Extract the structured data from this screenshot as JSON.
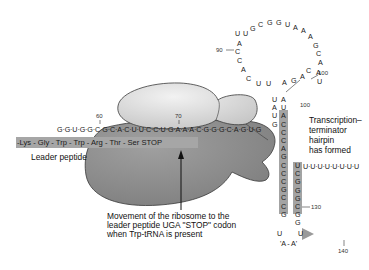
{
  "diagram": {
    "mrna": {
      "leader_sequence": "G·G·U·G·G·C·G·C·A·C·U·U·C·C·U·G·A·A·A·C·G·G·G·C·A·G·U·G",
      "leader_sequence_part1": "G·G·U·G·G·C·G·",
      "leader_sequence_part2": "C·A·C·U·U·C·C·U·G·A·A·A·C·G·G·G·C·A·G·U·G",
      "position_60": "60",
      "position_70": "70",
      "position_90": "90",
      "position_100_loop": "100",
      "position_100_stem": "100",
      "position_130": "130",
      "position_140": "140",
      "loop_nucleotides": [
        "U",
        "A",
        "C",
        "C",
        "A",
        "C",
        "U",
        "U",
        "A",
        "G",
        "A",
        "C",
        "U",
        "A",
        "A",
        "C",
        "G",
        "A",
        "A",
        "A",
        "U",
        "G",
        "G",
        "C",
        "G",
        "U",
        "A",
        "C",
        "C",
        "U"
      ],
      "poly_u_tail": "U·U·U·U·U·U·U·U",
      "bottom_loop": "'A - A'",
      "bottom_u_left": "U",
      "bottom_u_right": "U",
      "stem_left": [
        "U",
        "A",
        "U",
        "A",
        "C",
        "C",
        "C",
        "A",
        "G",
        "C",
        "C",
        "C",
        "G",
        "C",
        "C",
        "G"
      ],
      "stem_right": [
        "A",
        "U",
        "G",
        "",
        "",
        "",
        "",
        "U",
        "C",
        "G",
        "G",
        "G",
        "C",
        "G",
        "G",
        "G"
      ]
    },
    "peptide": {
      "sequence": "-Lys - Gly - Trp - Trp - Arg - Thr - Ser   STOP",
      "label": "Leader peptide"
    },
    "annotations": {
      "hairpin_label": "Transcription– terminator hairpin has formed",
      "hairpin_line1": "Transcription–",
      "hairpin_line2": "terminator",
      "hairpin_line3": "hairpin",
      "hairpin_line4": "has formed",
      "movement_line1": "Movement of the ribosome to the",
      "movement_line2": "leader peptide UGA \"STOP\" codon",
      "movement_line3": "when Trp-tRNA is present"
    },
    "colors": {
      "ribosome_large": "#8c8c8c",
      "ribosome_small": "#d6d6d6",
      "highlight_bar": "#a6a6a6",
      "outline": "#3a3a3a"
    }
  }
}
